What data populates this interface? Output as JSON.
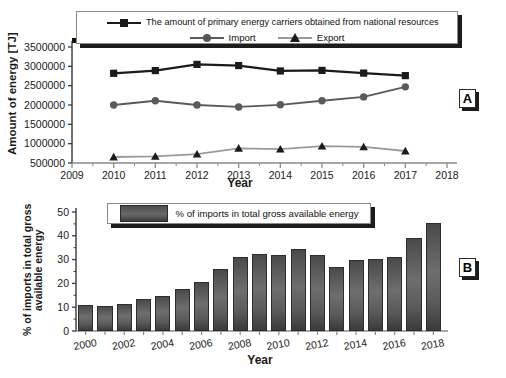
{
  "figure": {
    "panel_a_tag": "A",
    "panel_b_tag": "B"
  },
  "chart_data": [
    {
      "id": "panel_a",
      "type": "line",
      "title": "",
      "xlabel": "Year",
      "ylabel": "Amount of energy [TJ]",
      "x": [
        2010,
        2011,
        2012,
        2013,
        2014,
        2015,
        2016,
        2017
      ],
      "xlim": [
        2009,
        2018
      ],
      "ylim": [
        500000,
        3500000
      ],
      "xticks": [
        "2009",
        "2010",
        "2011",
        "2012",
        "2013",
        "2014",
        "2015",
        "2016",
        "2017",
        "2018"
      ],
      "yticks": [
        "500000",
        "1000000",
        "1500000",
        "2000000",
        "2500000",
        "3000000",
        "3500000"
      ],
      "grid": false,
      "legend_position": "top",
      "series": [
        {
          "name": "The amount of primary energy carriers obtained from national resources",
          "marker": "square",
          "color": "#1b1b1b",
          "values": [
            2820000,
            2890000,
            3050000,
            3020000,
            2880000,
            2895000,
            2825000,
            2760000
          ]
        },
        {
          "name": "Import",
          "marker": "circle",
          "color": "#5a5a5a",
          "values": [
            2000000,
            2110000,
            2000000,
            1950000,
            2005000,
            2110000,
            2210000,
            2470000
          ]
        },
        {
          "name": "Export",
          "marker": "triangle",
          "color": "#9a9a9a",
          "values": [
            655000,
            672000,
            730000,
            880000,
            860000,
            935000,
            915000,
            810000
          ]
        }
      ]
    },
    {
      "id": "panel_b",
      "type": "bar",
      "title": "",
      "xlabel": "Year",
      "ylabel": "% of imports in total gross available energy",
      "legend_label": "% of imports in total gross available energy",
      "xlim": [
        1999,
        2019
      ],
      "ylim": [
        0,
        50
      ],
      "xticks": [
        "2000",
        "2002",
        "2004",
        "2006",
        "2008",
        "2010",
        "2012",
        "2014",
        "2016",
        "2018"
      ],
      "yticks": [
        "0",
        "10",
        "20",
        "30",
        "40",
        "50"
      ],
      "grid": false,
      "legend_position": "top-left",
      "bar_color": "#5a5a5a",
      "categories": [
        2000,
        2001,
        2002,
        2003,
        2004,
        2005,
        2006,
        2007,
        2008,
        2009,
        2010,
        2011,
        2012,
        2013,
        2014,
        2015,
        2016,
        2017,
        2018
      ],
      "values": [
        10.8,
        10.6,
        11.5,
        13.4,
        14.9,
        17.8,
        20.5,
        25.9,
        31.1,
        32.3,
        31.8,
        34.3,
        32.0,
        26.7,
        29.8,
        30.3,
        31.3,
        39.0,
        45.3
      ]
    }
  ]
}
